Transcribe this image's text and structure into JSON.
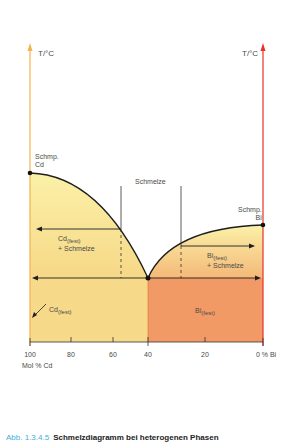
{
  "axes": {
    "left_unit": "T/°C",
    "right_unit": "T/°C",
    "left_color": "#f3b24a",
    "right_color": "#e5322b"
  },
  "labels": {
    "melt_cd_line1": "Schmp.",
    "melt_cd_line2": "Cd",
    "melt_bi_line1": "Schmp.",
    "melt_bi_line2": "Bi",
    "liquid": "Schmelze",
    "cd_solid_melt_main": "Cd",
    "cd_solid_melt_sub": "(fest)",
    "cd_solid_melt_plus": "+ Schmelze",
    "bi_solid_melt_main": "Bi",
    "bi_solid_melt_sub": "(fest)",
    "bi_solid_melt_plus": "+ Schmelze",
    "cd_solid_main": "Cd",
    "cd_solid_sub": "(fest)",
    "bi_solid_main": "Bi",
    "bi_solid_sub": "(fest)"
  },
  "x_ticks": [
    {
      "label": "100"
    },
    {
      "label": "80"
    },
    {
      "label": "60"
    },
    {
      "label": "40"
    },
    {
      "label": "20"
    },
    {
      "label": "0 % Bi"
    }
  ],
  "x_axis_title": "Mol % Cd",
  "caption": {
    "number": "Abb. 1.3.4.5",
    "text": "Schmelzdiagramm bei heterogenen Phasen"
  },
  "colors": {
    "cd_region": "#f7d98a",
    "bi_region": "#f29a66",
    "two_phase_top": "#fbf3b3",
    "line": "#1e1e1e"
  }
}
